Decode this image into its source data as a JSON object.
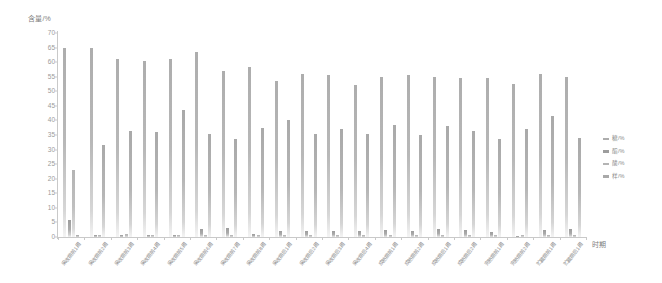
{
  "chart_data": {
    "type": "bar",
    "title": "",
    "ylabel": "含量/%",
    "xlabel": "时期",
    "ylim": [
      0,
      70
    ],
    "ytick_labels": [
      "0",
      "5",
      "10",
      "15",
      "20",
      "25",
      "30",
      "35",
      "40",
      "45",
      "50",
      "55",
      "60",
      "65",
      "70"
    ],
    "ytick_values": [
      0,
      5,
      10,
      15,
      20,
      25,
      30,
      35,
      40,
      45,
      50,
      55,
      60,
      65,
      70
    ],
    "grid": false,
    "legend_position": "right",
    "categories": [
      "采收期前1周",
      "采收期前2周",
      "采收期前3周",
      "采收期前4周",
      "采收期前5周",
      "采收期前6周",
      "采收期前7周",
      "采收期前8周",
      "采收期后1周",
      "采收期后2周",
      "采收期后3周",
      "采收期后4周",
      "成熟期前1周",
      "成熟期前2周",
      "成熟期后1周",
      "成熟期后2周",
      "完熟期前1周",
      "完熟期前2周",
      "贮藏期前1周",
      "贮藏期后1周"
    ],
    "series": [
      {
        "name": "糖/%",
        "color": "#adadad",
        "values": [
          65.0,
          65.0,
          61.0,
          60.5,
          61.0,
          63.5,
          57.0,
          58.5,
          53.5,
          56.0,
          55.5,
          52.0,
          55.0,
          55.5,
          55.0,
          54.5,
          54.5,
          52.5,
          56.0,
          55.0
        ]
      },
      {
        "name": "酯/%",
        "color": "#9d9d9d",
        "values": [
          6.0,
          0.7,
          0.8,
          0.6,
          0.6,
          2.8,
          3.0,
          1.2,
          2.0,
          2.1,
          2.0,
          2.0,
          2.3,
          2.1,
          2.8,
          2.3,
          1.6,
          0.5,
          2.4,
          2.6
        ]
      },
      {
        "name": "酸/%",
        "color": "#b4b4b4",
        "values": [
          23.0,
          0.8,
          0.9,
          0.7,
          0.7,
          0.8,
          0.8,
          0.7,
          0.7,
          0.8,
          0.8,
          0.8,
          0.8,
          0.8,
          0.8,
          0.8,
          0.7,
          0.7,
          0.8,
          0.8
        ]
      },
      {
        "name": "样/%",
        "color": "#a9a9a9",
        "values": [
          0.6,
          31.5,
          36.5,
          36.0,
          43.5,
          35.5,
          33.5,
          37.5,
          40.0,
          35.5,
          37.0,
          35.5,
          38.5,
          35.0,
          38.0,
          36.5,
          33.5,
          37.0,
          41.5,
          34.0
        ]
      }
    ]
  }
}
